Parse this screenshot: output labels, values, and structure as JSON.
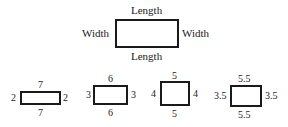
{
  "main_figure": {
    "top": "Length",
    "bottom": "Length",
    "left": "Width",
    "right": "Width"
  },
  "rectangles": [
    {
      "length": "7",
      "width": "2"
    },
    {
      "length": "6",
      "width": "3"
    },
    {
      "length": "5",
      "width": "4"
    },
    {
      "length": "5.5",
      "width": "3.5"
    }
  ]
}
